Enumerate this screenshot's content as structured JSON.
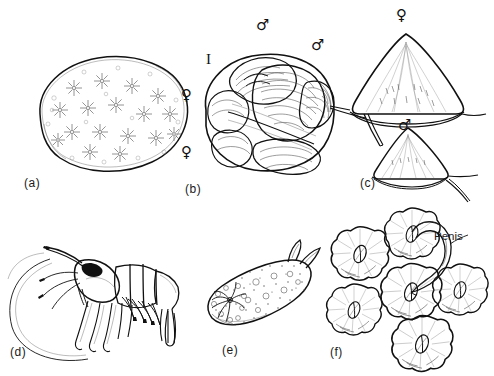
{
  "figure": {
    "background_color": "#ffffff",
    "ink_color": "#111111",
    "width": 494,
    "height": 376
  },
  "panels": [
    {
      "id": "a",
      "label": "(a)",
      "subject": "colonial-tunicate-ascidian",
      "description": "Rounded encrusting colony with star-shaped zooid systems",
      "annotations": []
    },
    {
      "id": "b",
      "label": "(b)",
      "subject": "slipper-limpet-stack-crepidula",
      "description": "Stacked chain of slipper limpets with sex symbols marking individuals",
      "annotations": [
        {
          "name": "male-symbol-upper",
          "glyph": "♂"
        },
        {
          "name": "male-symbol-right",
          "glyph": "♂"
        },
        {
          "name": "intersex-marker",
          "glyph": "I"
        },
        {
          "name": "female-symbol-upper",
          "glyph": "♀"
        },
        {
          "name": "female-symbol-lower",
          "glyph": "♀"
        }
      ]
    },
    {
      "id": "c",
      "label": "(c)",
      "subject": "limpet-shells-lateral",
      "description": "Two conical limpet shells in lateral view, larger female above smaller male",
      "annotations": [
        {
          "name": "female-symbol",
          "glyph": "♀"
        },
        {
          "name": "male-symbol",
          "glyph": "♂"
        }
      ]
    },
    {
      "id": "d",
      "label": "(d)",
      "subject": "caridean-shrimp-prawn",
      "description": "Lateral view of a shrimp with rostrum, antennae, pereiopods and tail fan",
      "annotations": []
    },
    {
      "id": "e",
      "label": "(e)",
      "subject": "nudibranch-sea-slug",
      "description": "Dorsal view of a nudibranch with rhinophores and branchial plume",
      "annotations": []
    },
    {
      "id": "f",
      "label": "(f)",
      "subject": "barnacle-cluster",
      "description": "Cluster of six acorn barnacles viewed from above, one extending an elongate penis to a neighbour",
      "annotations": [
        {
          "name": "penis-label",
          "glyph": "Penis",
          "text": "Penis"
        }
      ]
    }
  ],
  "labels": {
    "a": "(a)",
    "b": "(b)",
    "c": "(c)",
    "d": "(d)",
    "e": "(e)",
    "f": "(f)",
    "penis": "Penis",
    "intersex": "I",
    "female": "♀",
    "male": "♂"
  }
}
